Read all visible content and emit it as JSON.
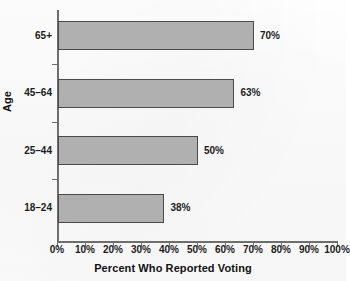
{
  "chart_data": {
    "type": "bar",
    "orientation": "horizontal",
    "title": "",
    "xlabel": "Percent Who Reported Voting",
    "ylabel": "Age",
    "categories": [
      "18–24",
      "25–44",
      "45–64",
      "65+"
    ],
    "values": [
      38,
      50,
      63,
      70
    ],
    "value_labels": [
      "38%",
      "50%",
      "63%",
      "70%"
    ],
    "xlim": [
      0,
      100
    ],
    "xticks": [
      0,
      10,
      20,
      30,
      40,
      50,
      60,
      70,
      80,
      90,
      100
    ],
    "xtick_labels": [
      "0%",
      "10%",
      "20%",
      "30%",
      "40%",
      "50%",
      "60%",
      "70%",
      "80%",
      "90%",
      "100%"
    ],
    "grid": false,
    "legend": false,
    "bar_color": "#b0b0b0",
    "bar_edge_color": "#4a4a4a",
    "axis_color": "#6e6e6e",
    "background_color": "#ffffff"
  },
  "bars": [
    {
      "category": "65+",
      "value": 70,
      "label": "70%"
    },
    {
      "category": "45–64",
      "value": 63,
      "label": "63%"
    },
    {
      "category": "25–44",
      "value": 50,
      "label": "50%"
    },
    {
      "category": "18–24",
      "value": 38,
      "label": "38%"
    }
  ],
  "xticks": [
    {
      "label": "0%",
      "value": 0
    },
    {
      "label": "10%",
      "value": 10
    },
    {
      "label": "20%",
      "value": 20
    },
    {
      "label": "30%",
      "value": 30
    },
    {
      "label": "40%",
      "value": 40
    },
    {
      "label": "50%",
      "value": 50
    },
    {
      "label": "60%",
      "value": 60
    },
    {
      "label": "70%",
      "value": 70
    },
    {
      "label": "80%",
      "value": 80
    },
    {
      "label": "90%",
      "value": 90
    },
    {
      "label": "100%",
      "value": 100
    }
  ],
  "axis_titles": {
    "x": "Percent Who Reported Voting",
    "y": "Age"
  }
}
